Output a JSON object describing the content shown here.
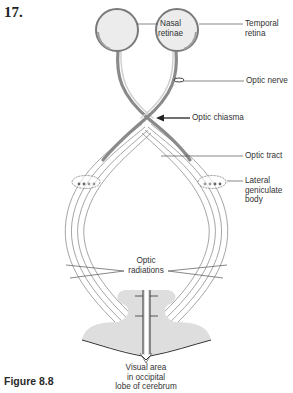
{
  "question_number": "17.",
  "figure_caption": "Figure 8.8",
  "labels": {
    "nasal_retinae": [
      "Nasal",
      "retinae"
    ],
    "temporal_retina": [
      "Temporal",
      "retina"
    ],
    "optic_nerve": "Optic nerve",
    "optic_chiasma": "Optic chiasma",
    "optic_tract": "Optic tract",
    "lateral_geniculate_body": [
      "Lateral",
      "geniculate",
      "body"
    ],
    "optic_radiations": [
      "Optic",
      "radiations"
    ],
    "visual_area": [
      "Visual area",
      "in occipital",
      "lobe of cerebrum"
    ]
  },
  "colors": {
    "eyeball_fill": "#ececec",
    "eyeball_stroke": "#777777",
    "nerve_dark": "#8a8a8a",
    "nerve_light": "#c9c9c9",
    "cortex_fill": "#dedede",
    "leader_line": "#555555"
  }
}
